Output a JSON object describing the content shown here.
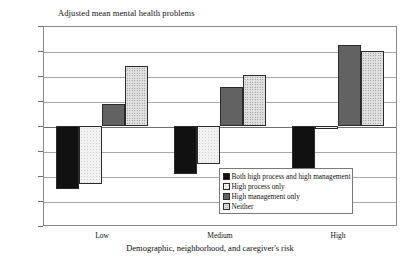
{
  "chart_data": {
    "type": "bar",
    "title": "Adjusted mean mental health problems",
    "xlabel": "Demographic, neighborhood, and caregiver's risk",
    "ylabel": "Adjusted mean mental health problems",
    "categories": [
      "Low",
      "Medium",
      "High"
    ],
    "ylim": [
      -0.8,
      0.8
    ],
    "yticks": [
      "0.8",
      "0.6",
      "0.4",
      "0.2",
      "0",
      "-0.2",
      "-0.4",
      "-0.6",
      "-0.8"
    ],
    "ytick_values": [
      0.8,
      0.6,
      0.4,
      0.2,
      0,
      -0.2,
      -0.4,
      -0.6,
      -0.8
    ],
    "grid": true,
    "legend_position": "inside-bottom-right",
    "series": [
      {
        "name": "Both high process and high management",
        "pattern": "solid-black",
        "values": [
          -0.5,
          -0.38,
          -0.34
        ]
      },
      {
        "name": "High process only",
        "pattern": "white",
        "values": [
          -0.46,
          -0.3,
          -0.02
        ]
      },
      {
        "name": "High management only",
        "pattern": "gray-dot",
        "values": [
          0.18,
          0.31,
          0.65
        ]
      },
      {
        "name": "Neither",
        "pattern": "light-dot",
        "values": [
          0.48,
          0.41,
          0.6
        ]
      }
    ]
  }
}
